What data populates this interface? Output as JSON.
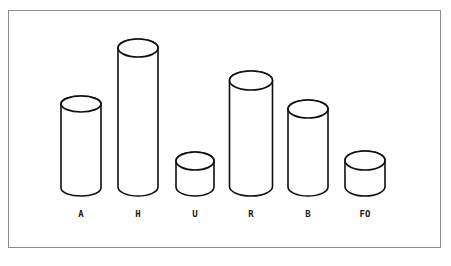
{
  "figure": {
    "frame": {
      "name": "chart-border",
      "x": 8,
      "y": 10,
      "width": 433,
      "height": 238,
      "stroke_color": "#8c8c90",
      "background_color": "#ffffff"
    },
    "ink_color": "#101010",
    "fill_color": "#ffffff"
  },
  "chart_data": {
    "type": "bar",
    "style": "3d-cylinder",
    "title": "",
    "subtitle": "",
    "xlabel": "",
    "ylabel": "",
    "grid": false,
    "legend": null,
    "axis_visible": false,
    "baseline_y": 196,
    "categories": [
      "A",
      "H",
      "U",
      "R",
      "B",
      "FO"
    ],
    "values": [
      100,
      157,
      44,
      125,
      96,
      45
    ],
    "ylim": [
      0,
      165
    ],
    "tick_labels": [],
    "annotations": [],
    "bars": [
      {
        "label": "A",
        "value": 100,
        "center_x": 81,
        "top_y": 96,
        "bottom_y": 196,
        "radius_x": 20,
        "radius_y": 8,
        "label_x": 81,
        "label_y": 209
      },
      {
        "label": "H",
        "value": 157,
        "center_x": 138,
        "top_y": 39,
        "bottom_y": 196,
        "radius_x": 20,
        "radius_y": 9,
        "label_x": 138,
        "label_y": 209
      },
      {
        "label": "U",
        "value": 44,
        "center_x": 195,
        "top_y": 152,
        "bottom_y": 196,
        "radius_x": 19,
        "radius_y": 9,
        "label_x": 195,
        "label_y": 209
      },
      {
        "label": "R",
        "value": 125,
        "center_x": 251,
        "top_y": 71,
        "bottom_y": 196,
        "radius_x": 21.5,
        "radius_y": 9.5,
        "label_x": 251,
        "label_y": 209
      },
      {
        "label": "B",
        "value": 96,
        "center_x": 308,
        "top_y": 100,
        "bottom_y": 196,
        "radius_x": 20,
        "radius_y": 9,
        "label_x": 308,
        "label_y": 209
      },
      {
        "label": "FO",
        "value": 45,
        "center_x": 365,
        "top_y": 151,
        "bottom_y": 196,
        "radius_x": 20,
        "radius_y": 9.5,
        "label_x": 365,
        "label_y": 209
      }
    ]
  }
}
